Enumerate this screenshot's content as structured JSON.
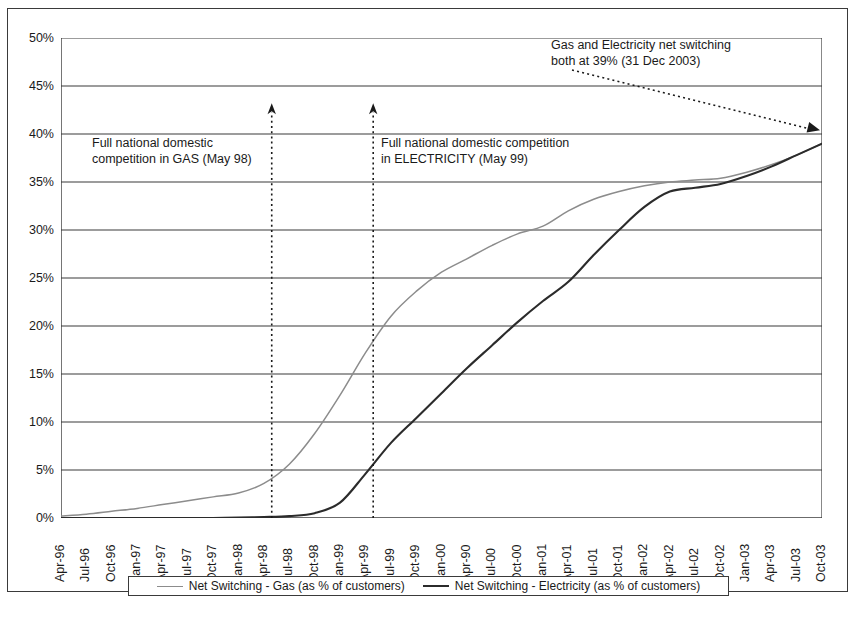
{
  "chart_data": {
    "type": "line",
    "title": "",
    "xlabel": "",
    "ylabel": "",
    "ylim": [
      0,
      50
    ],
    "y_tick_labels": [
      "50%",
      "45%",
      "40%",
      "35%",
      "30%",
      "25%",
      "20%",
      "15%",
      "10%",
      "5%",
      "0%"
    ],
    "y_tick_values": [
      50,
      45,
      40,
      35,
      30,
      25,
      20,
      15,
      10,
      5,
      0
    ],
    "grid": "horizontal",
    "legend_position": "bottom",
    "categories": [
      "Apr-96",
      "Jul-96",
      "Oct-96",
      "Jan-97",
      "Apr-97",
      "Jul-97",
      "Oct-97",
      "Jan-98",
      "Apr-98",
      "Jul-98",
      "Oct-98",
      "Jan-99",
      "Apr-99",
      "Jul-99",
      "Oct-99",
      "Jan-00",
      "Apr-90",
      "Jul-00",
      "Oct-00",
      "Jan-01",
      "Apr-01",
      "Jul-01",
      "Oct-01",
      "Jan-02",
      "Apr-02",
      "Jul-02",
      "Oct-02",
      "Jan-03",
      "Apr-03",
      "Jul-03",
      "Oct-03"
    ],
    "series": [
      {
        "name": "Net Switching - Gas (as % of customers)",
        "color": "#8c8c8c",
        "values": [
          0.2,
          0.4,
          0.7,
          1.0,
          1.4,
          1.8,
          2.2,
          2.6,
          3.6,
          5.6,
          8.8,
          12.8,
          17.2,
          21.0,
          23.6,
          25.6,
          27.0,
          28.4,
          29.6,
          30.4,
          32.0,
          33.2,
          34.0,
          34.6,
          35.0,
          35.2,
          35.4,
          36.0,
          36.8,
          37.8,
          39.0
        ]
      },
      {
        "name": "Net Switching - Electricity (as % of customers)",
        "color": "#2b2b2b",
        "values": [
          0.0,
          0.0,
          0.0,
          0.0,
          0.0,
          0.0,
          0.0,
          0.05,
          0.1,
          0.2,
          0.5,
          1.6,
          4.6,
          7.8,
          10.4,
          13.0,
          15.6,
          18.0,
          20.4,
          22.6,
          24.6,
          27.4,
          30.0,
          32.4,
          34.0,
          34.4,
          34.8,
          35.6,
          36.6,
          37.8,
          39.0
        ]
      }
    ],
    "annotations": [
      {
        "id": "gas-competition",
        "text": "Full national domestic\ncompetition in GAS (May 98)",
        "marker": "vertical-dotted-arrow",
        "at_category": "May-98"
      },
      {
        "id": "electricity-competition",
        "text": "Full national domestic competition\nin ELECTRICITY (May 99)",
        "marker": "vertical-dotted-arrow",
        "at_category": "May-99"
      },
      {
        "id": "convergence",
        "text": "Gas and Electricity net switching\nboth at 39% (31 Dec 2003)",
        "marker": "dotted-arrow-pointer",
        "value": "39%",
        "at_category": "31 Dec 2003"
      }
    ]
  },
  "legend": {
    "entries": [
      {
        "label": "Net Switching - Gas (as % of customers)"
      },
      {
        "label": "Net Switching - Electricity (as % of customers)"
      }
    ]
  },
  "caption": {
    "text": ""
  }
}
